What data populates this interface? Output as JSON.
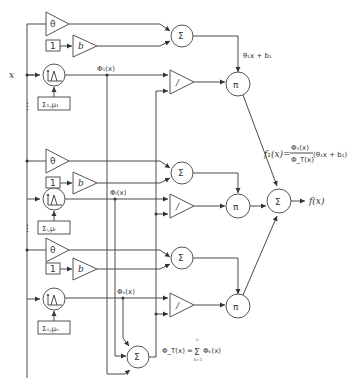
{
  "diagram": {
    "input_label": "x",
    "output_label": "f(x)",
    "units": [
      {
        "theta_label": "θ",
        "one_label": "1",
        "bias_label": "b",
        "sum_label": "Σ",
        "rbf_params_label": "Σ₁,μ₁",
        "phi_label": "Φ₁(x)",
        "div_label": "/",
        "prod_label": "π",
        "linear_label": "θ₁x + b₁"
      },
      {
        "theta_label": "θ",
        "one_label": "1",
        "bias_label": "b",
        "sum_label": "Σ",
        "rbf_params_label": "Σᵢ,μᵢ",
        "phi_label": "Φᵢ(x)",
        "div_label": "/",
        "prod_label": "π"
      },
      {
        "theta_label": "θ",
        "one_label": "1",
        "bias_label": "b",
        "sum_label": "Σ",
        "rbf_params_label": "Σₙ,μₙ",
        "phi_label": "Φₙ(x)",
        "div_label": "/",
        "prod_label": "π"
      }
    ],
    "total_sum_label": "Σ",
    "final_sum_label": "Σ",
    "f1_equation": {
      "lhs": "f₁(x)=",
      "numerator": "Φ₁(x)",
      "denominator": "Φ_T(x)",
      "rhs": "(θ₁x + b₁)"
    },
    "phi_total_equation": {
      "lhs": "Φ_T(x) =",
      "sum_symbol": "Σ",
      "upper": "n",
      "lower": "k=1",
      "term": "Φₖ(x)"
    },
    "ellipsis": "⋮"
  }
}
